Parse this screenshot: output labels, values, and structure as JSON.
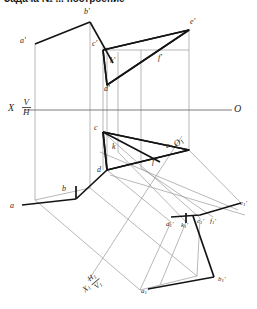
{
  "header": {
    "cut_text": "Задача №  ... построение"
  },
  "drawing": {
    "title": "Descriptive geometry: three-projection construction of prism and intersecting line",
    "axes": [
      {
        "name": "ground-line-x",
        "label_left": "X",
        "label_right": "O",
        "fraction_top": "V",
        "fraction_bottom": "H"
      },
      {
        "name": "auxiliary-ground-line-x1",
        "label_left": "X1",
        "label_right": "O1",
        "fraction_top": "H1",
        "fraction_bottom": "V1"
      }
    ],
    "labels": {
      "vertical_projection": [
        {
          "id": "a-prime",
          "text": "a'",
          "x": 20,
          "y": 41
        },
        {
          "id": "b-prime",
          "text": "b'",
          "x": 83,
          "y": 8
        },
        {
          "id": "c-prime",
          "text": "c'",
          "x": 91,
          "y": 44
        },
        {
          "id": "d-prime",
          "text": "d'",
          "x": 104,
          "y": 85
        },
        {
          "id": "e-prime",
          "text": "e'",
          "x": 186,
          "y": 22
        },
        {
          "id": "f-prime",
          "text": "f'",
          "x": 160,
          "y": 57
        },
        {
          "id": "k-prime",
          "text": "k'",
          "x": 108,
          "y": 58
        }
      ],
      "horizontal_projection": [
        {
          "id": "a",
          "text": "a",
          "x": 10,
          "y": 204
        },
        {
          "id": "b",
          "text": "b",
          "x": 50,
          "y": 189
        },
        {
          "id": "c",
          "text": "c",
          "x": 93,
          "y": 129
        },
        {
          "id": "d",
          "text": "d",
          "x": 96,
          "y": 168
        },
        {
          "id": "e",
          "text": "e",
          "x": 166,
          "y": 148
        },
        {
          "id": "f",
          "text": "f",
          "x": 153,
          "y": 161
        },
        {
          "id": "k",
          "text": "k",
          "x": 110,
          "y": 148
        }
      ],
      "auxiliary_projection": [
        {
          "id": "a1-prime",
          "text": "a1'",
          "x": 136,
          "y": 288
        },
        {
          "id": "b1-prime",
          "text": "b1'",
          "x": 217,
          "y": 279
        },
        {
          "id": "c1-prime",
          "text": "c1'",
          "x": 198,
          "y": 219
        },
        {
          "id": "d1-prime",
          "text": "d1'",
          "x": 168,
          "y": 223
        },
        {
          "id": "e1-prime",
          "text": "e1'",
          "x": 239,
          "y": 204
        },
        {
          "id": "f1-prime",
          "text": "f1'",
          "x": 211,
          "y": 219
        },
        {
          "id": "k1-prime",
          "text": "k1'",
          "x": 183,
          "y": 224
        }
      ]
    },
    "colors": {
      "heavy_line": "#1a1a1a",
      "thin_line": "#8d8d8d",
      "axis_line": "#6e6e6e",
      "text": "#2a2a2a",
      "background": "#ffffff"
    },
    "geometry": {
      "vertical_prism_outline": "a'-b'-c'-d' prism front face with projection lines down to ground line",
      "triangle_vertical": "c'-e'-d' with point k' inside",
      "triangle_horizontal": "c-e-d with point k inside",
      "auxiliary_band": "a1'-b1'-c1'-d1'-e1'-f1' inclined projection band"
    }
  }
}
